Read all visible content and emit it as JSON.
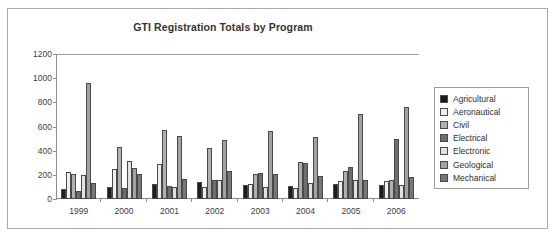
{
  "chart_data": {
    "type": "bar",
    "title": "GTI Registration Totals by Program",
    "xlabel": "",
    "ylabel": "",
    "ylim": [
      0,
      1200
    ],
    "yticks": [
      0,
      200,
      400,
      600,
      800,
      1000,
      1200
    ],
    "grid": false,
    "legend_position": "right",
    "categories": [
      "1999",
      "2000",
      "2001",
      "2002",
      "2003",
      "2004",
      "2005",
      "2006"
    ],
    "series": [
      {
        "name": "Agricultural",
        "color": "#1c1c1c",
        "values": [
          85,
          100,
          125,
          140,
          120,
          105,
          125,
          120
        ]
      },
      {
        "name": "Aeronautical",
        "color": "#efefef",
        "values": [
          220,
          245,
          290,
          100,
          125,
          95,
          145,
          150
        ]
      },
      {
        "name": "Civil",
        "color": "#b0b0b0",
        "values": [
          205,
          430,
          575,
          420,
          210,
          305,
          230,
          155
        ]
      },
      {
        "name": "Electrical",
        "color": "#6e6e6e",
        "values": [
          65,
          90,
          105,
          160,
          215,
          300,
          265,
          495
        ]
      },
      {
        "name": "Electronic",
        "color": "#e2e2e2",
        "values": [
          200,
          315,
          100,
          155,
          100,
          130,
          160,
          115
        ]
      },
      {
        "name": "Geological",
        "color": "#a2a2a2",
        "values": [
          960,
          255,
          525,
          490,
          560,
          510,
          700,
          760
        ]
      },
      {
        "name": "Mechanical",
        "color": "#787878",
        "values": [
          130,
          205,
          165,
          235,
          205,
          190,
          155,
          185
        ]
      }
    ]
  }
}
